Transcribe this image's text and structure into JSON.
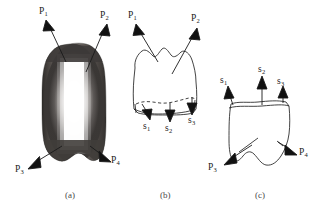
{
  "figure": {
    "background_color": "#ffffff",
    "ink_color": "#1a1a1a",
    "caption_color": "#4a4a4a"
  },
  "panels": [
    {
      "id": "a",
      "caption": "(a)",
      "caption_x": 65,
      "caption_y": 190,
      "kind": "shaded-solid",
      "description": "dark shaded rounded tooth-like solid with bright vertical highlight",
      "fill_dark": "#4e4a48",
      "fill_edge": "#2e2c2b",
      "highlight_color": "#ffffff",
      "bounds": {
        "x": 42,
        "y": 44,
        "width": 64,
        "height": 122
      },
      "vectors": [
        {
          "name": "P1",
          "label": "P",
          "sub": "1",
          "label_x": 39,
          "label_y": 8,
          "tail_x": 66,
          "tail_y": 62,
          "head_x": 48,
          "head_y": 24,
          "direction": "up-left"
        },
        {
          "name": "P2",
          "label": "P",
          "sub": "2",
          "label_x": 100,
          "label_y": 12,
          "tail_x": 86,
          "tail_y": 72,
          "head_x": 105,
          "head_y": 28,
          "direction": "up-right"
        },
        {
          "name": "P3",
          "label": "P",
          "sub": "3",
          "label_x": 16,
          "label_y": 167,
          "tail_x": 62,
          "tail_y": 146,
          "head_x": 30,
          "head_y": 165,
          "direction": "down-left"
        },
        {
          "name": "P4",
          "label": "P",
          "sub": "4",
          "label_x": 110,
          "label_y": 158,
          "tail_x": 90,
          "tail_y": 146,
          "head_x": 108,
          "head_y": 157,
          "direction": "down-right"
        }
      ]
    },
    {
      "id": "b",
      "caption": "(b)",
      "caption_x": 160,
      "caption_y": 190,
      "kind": "outline",
      "description": "hand-drawn crown outline with dashed cervical line",
      "bounds": {
        "x": 132,
        "y": 48,
        "width": 66,
        "height": 68
      },
      "vectors": [
        {
          "name": "P1",
          "label": "P",
          "sub": "1",
          "label_x": 129,
          "label_y": 12,
          "tail_x": 158,
          "tail_y": 62,
          "head_x": 137,
          "head_y": 28,
          "direction": "up-left"
        },
        {
          "name": "P2",
          "label": "P",
          "sub": "2",
          "label_x": 192,
          "label_y": 14,
          "tail_x": 174,
          "tail_y": 74,
          "head_x": 196,
          "head_y": 32,
          "direction": "up-right"
        },
        {
          "name": "s1",
          "label": "s",
          "sub": "1",
          "label_x": 144,
          "label_y": 122,
          "tail_x": 141,
          "tail_y": 104,
          "head_x": 149,
          "head_y": 120,
          "direction": "down"
        },
        {
          "name": "s2",
          "label": "s",
          "sub": "2",
          "label_x": 166,
          "label_y": 124,
          "tail_x": 170,
          "tail_y": 104,
          "head_x": 170,
          "head_y": 122,
          "direction": "down"
        },
        {
          "name": "s3",
          "label": "s",
          "sub": "3",
          "label_x": 189,
          "label_y": 116,
          "tail_x": 192,
          "tail_y": 98,
          "head_x": 192,
          "head_y": 114,
          "direction": "down"
        }
      ]
    },
    {
      "id": "c",
      "caption": "(c)",
      "caption_x": 255,
      "caption_y": 190,
      "kind": "outline",
      "description": "hand-drawn root outline with upward s vectors and downward P vectors",
      "bounds": {
        "x": 228,
        "y": 100,
        "width": 62,
        "height": 66
      },
      "vectors": [
        {
          "name": "s1",
          "label": "s",
          "sub": "1",
          "label_x": 222,
          "label_y": 78,
          "tail_x": 233,
          "tail_y": 104,
          "head_x": 230,
          "head_y": 88,
          "direction": "up"
        },
        {
          "name": "s2",
          "label": "s",
          "sub": "2",
          "label_x": 261,
          "label_y": 68,
          "tail_x": 262,
          "tail_y": 104,
          "head_x": 262,
          "head_y": 78,
          "direction": "up"
        },
        {
          "name": "s3",
          "label": "s",
          "sub": "3",
          "label_x": 279,
          "label_y": 79,
          "tail_x": 283,
          "tail_y": 102,
          "head_x": 283,
          "head_y": 88,
          "direction": "up"
        },
        {
          "name": "P3",
          "label": "P",
          "sub": "3",
          "label_x": 210,
          "label_y": 165,
          "tail_x": 252,
          "tail_y": 145,
          "head_x": 224,
          "head_y": 163,
          "direction": "down-left"
        },
        {
          "name": "P4",
          "label": "P",
          "sub": "4",
          "label_x": 299,
          "label_y": 150,
          "tail_x": 278,
          "tail_y": 142,
          "head_x": 296,
          "head_y": 152,
          "direction": "down-right"
        }
      ]
    }
  ]
}
